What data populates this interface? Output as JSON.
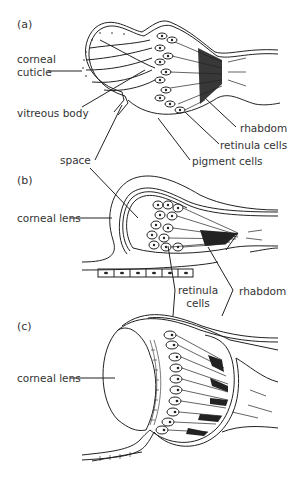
{
  "figure": {
    "panels": [
      {
        "id": "a",
        "label": "(a)",
        "annotations": {
          "corneal_cuticle_1": "corneal",
          "corneal_cuticle_2": "cuticle",
          "vitreous_body": "vitreous body",
          "space": "space",
          "rhabdom": "rhabdom",
          "retinula_cells": "retinula cells",
          "pigment_cells": "pigment cells"
        }
      },
      {
        "id": "b",
        "label": "(b)",
        "annotations": {
          "corneal_lens": "corneal lens",
          "retinula_cells_1": "retinula",
          "retinula_cells_2": "cells",
          "rhabdom": "rhabdom"
        }
      },
      {
        "id": "c",
        "label": "(c)",
        "annotations": {
          "corneal_lens": "corneal lens"
        }
      }
    ],
    "colors": {
      "line": "#222222",
      "background": "#ffffff"
    }
  }
}
